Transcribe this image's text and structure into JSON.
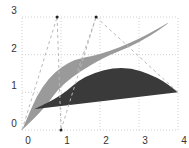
{
  "chart_data": {
    "type": "diagram",
    "title": "",
    "xlabel": "",
    "ylabel": "",
    "xlim": [
      0,
      4
    ],
    "ylim": [
      0,
      3
    ],
    "grid": true,
    "x_ticks": [
      "0",
      "1",
      "2",
      "3",
      "4"
    ],
    "y_ticks": [
      "0",
      "1",
      "2",
      "3"
    ],
    "shapes": [
      {
        "name": "light-region",
        "fill": "#9a9a9a",
        "description": "Region between quadratic/cubic Bezier curve from (0,0) up to (4,3) and lower chord",
        "points_upper": [
          [
            0,
            0
          ],
          [
            0.5,
            1.2
          ],
          [
            1.2,
            1.85
          ],
          [
            2,
            2.0
          ],
          [
            3,
            2.4
          ],
          [
            4,
            3
          ]
        ],
        "points_lower": [
          [
            4,
            3
          ],
          [
            3,
            2.3
          ],
          [
            2,
            1.9
          ],
          [
            1,
            1.2
          ],
          [
            0.6,
            0.6
          ],
          [
            0,
            0
          ]
        ]
      },
      {
        "name": "dark-region",
        "fill": "#3a3a3a",
        "description": "Filled Bezier arch from (0.3,0.55) to (4,1) peaking near (2.6,1.7)",
        "points": [
          [
            0.3,
            0.55
          ],
          [
            1,
            0.9
          ],
          [
            1.6,
            1.45
          ],
          [
            2.6,
            1.72
          ],
          [
            3.5,
            1.4
          ],
          [
            4,
            1.0
          ]
        ]
      }
    ],
    "control_points": [
      {
        "x": 0.9,
        "y": 3.0
      },
      {
        "x": 1.9,
        "y": 3.0
      },
      {
        "x": 1.0,
        "y": 0.0
      }
    ],
    "control_lines": [
      [
        [
          0,
          0
        ],
        [
          0.9,
          3.0
        ]
      ],
      [
        [
          0.9,
          3.0
        ],
        [
          1.0,
          0.0
        ]
      ],
      [
        [
          1.0,
          0.0
        ],
        [
          1.9,
          3.0
        ]
      ],
      [
        [
          1.9,
          3.0
        ],
        [
          4,
          1.0
        ]
      ],
      [
        [
          1.9,
          3.0
        ],
        [
          1.4,
          1.5
        ]
      ]
    ],
    "colors": {
      "light_fill": "#9a9a9a",
      "dark_fill": "#3a3a3a",
      "grid": "#d0d0d0",
      "dashed": "#b8b8b8",
      "point": "#222222"
    }
  }
}
